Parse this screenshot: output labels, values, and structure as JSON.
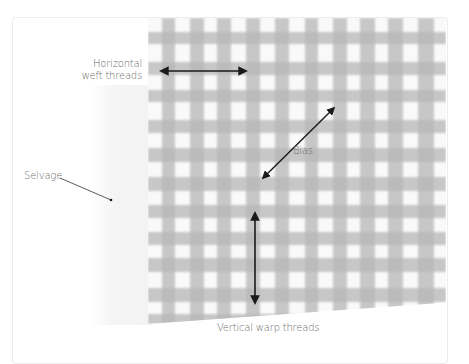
{
  "diagram": {
    "labels": {
      "weft_line1": "Horizontal",
      "weft_line2": "weft threads",
      "bias": "Bias",
      "selvage": "Selvage",
      "warp": "Vertical warp threads"
    },
    "colors": {
      "thread": "#9a9a9a",
      "arrow": "#1a1a1a",
      "label": "#6b6b6b",
      "background": "#ffffff",
      "card_border": "#ececec"
    },
    "arrows": [
      {
        "name": "weft-arrow",
        "from": [
          161,
          71
        ],
        "to": [
          246,
          71
        ],
        "double": true
      },
      {
        "name": "bias-arrow",
        "from": [
          263,
          178
        ],
        "to": [
          334,
          108
        ],
        "double": true
      },
      {
        "name": "warp-arrow",
        "from": [
          255,
          213
        ],
        "to": [
          255,
          303
        ],
        "double": true
      },
      {
        "name": "selvage-pointer",
        "from": [
          60,
          178
        ],
        "to": [
          111,
          200
        ],
        "double": false
      }
    ]
  }
}
